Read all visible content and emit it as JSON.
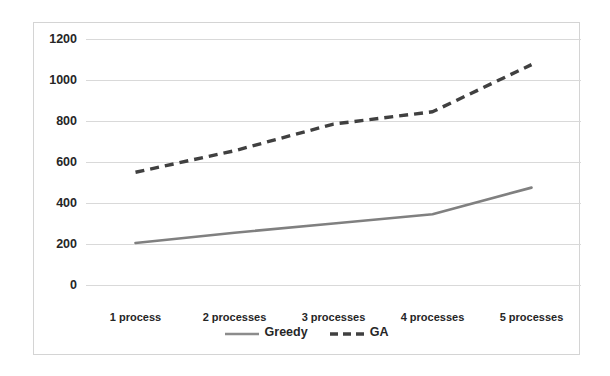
{
  "chart_data": {
    "type": "line",
    "title": "",
    "xlabel": "",
    "ylabel": "",
    "categories": [
      "1 process",
      "2 processes",
      "3 processes",
      "4 processes",
      "5 processes"
    ],
    "series": [
      {
        "name": "Greedy",
        "values": [
          205,
          255,
          300,
          345,
          475
        ],
        "style": "solid",
        "color": "#808080"
      },
      {
        "name": "GA",
        "values": [
          550,
          655,
          785,
          845,
          1075
        ],
        "style": "dashed",
        "color": "#404040"
      }
    ],
    "ylim": [
      0,
      1200
    ],
    "yticks": [
      0,
      200,
      400,
      600,
      800,
      1000,
      1200
    ],
    "ytick_labels": [
      "0",
      "200",
      "400",
      "600",
      "800",
      "1000",
      "1200"
    ],
    "grid": true,
    "grid_axis": "y",
    "grid_color": "#d9d9d9",
    "legend_position": "bottom",
    "plot_background": "#ffffff",
    "border_color": "#d4d4d4"
  },
  "legend": {
    "entries": [
      {
        "label": "Greedy",
        "swatch": "solid-line-swatch"
      },
      {
        "label": "GA",
        "swatch": "dashed-line-swatch"
      }
    ]
  }
}
